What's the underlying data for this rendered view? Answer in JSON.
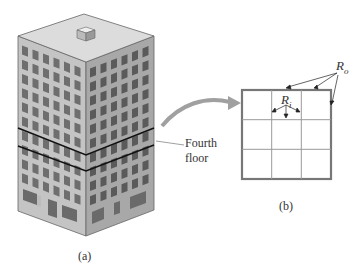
{
  "figure": {
    "panel_a": {
      "caption": "(a)",
      "subject": "isometric office building",
      "floors_visible": 10,
      "highlighted_floor_label": "Fourth floor",
      "highlighted_floor_label_line1": "Fourth",
      "highlighted_floor_label_line2": "floor"
    },
    "panel_b": {
      "caption": "(b)",
      "subject": "floor plan grid",
      "grid_rows": 3,
      "grid_cols": 3,
      "outer_label": "R",
      "outer_label_sub": "o",
      "inner_label": "R",
      "inner_label_sub": "i"
    },
    "connector": "curved-arrow"
  },
  "colors": {
    "line": "#555555",
    "outer_wall": "#777777",
    "roof": "#d8d8d8",
    "left_face": "#c4c4c4",
    "right_face": "#a8a8a8",
    "window": "#6a6a6a",
    "arrow": "#a0a0a0",
    "floor_band": "#111111"
  }
}
